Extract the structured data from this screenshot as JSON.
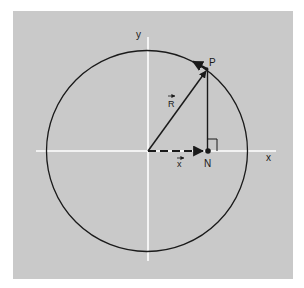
{
  "diagram": {
    "type": "vector-circle-projection",
    "colors": {
      "page_background": "#ffffff",
      "panel_background": "#c9c9c9",
      "axis_color": "#ffffff",
      "ink": "#1a1a1a"
    },
    "labels": {
      "y_axis": "y",
      "x_axis": "x",
      "point_p": "P",
      "point_n": "N",
      "vector_r": "R",
      "vector_x": "x"
    },
    "elements": [
      "circle centered at origin",
      "vector R from origin to P on circle",
      "tangent velocity arrow at P",
      "vertical drop line from P to N on x-axis",
      "right-angle marker at N",
      "dashed vector x from origin to N"
    ]
  }
}
